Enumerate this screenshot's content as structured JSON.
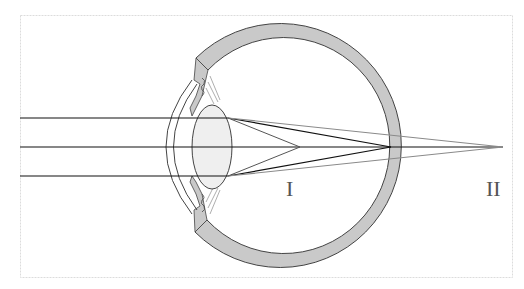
{
  "figure": {
    "labels": {
      "focus_1": "I",
      "focus_2": "II"
    },
    "colors": {
      "frame": "#d8d8d8",
      "sclera_fill": "#c9c9c9",
      "outline": "#444444",
      "ray_dark": "#111111",
      "ray_light": "#8a8a8a",
      "lens_fill": "#eeeeee",
      "label": "#555555"
    }
  }
}
